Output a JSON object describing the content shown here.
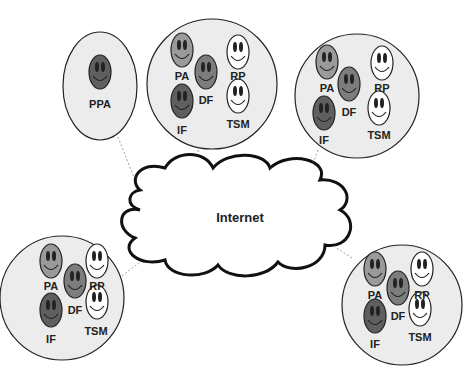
{
  "diagram": {
    "center_node": {
      "label": "Internet",
      "shape": "cloud"
    },
    "colors": {
      "group_fill": "#ececec",
      "stroke": "#222222",
      "agent_light": "#9a9a9a",
      "agent_mid": "#7d7d7d",
      "agent_dark": "#5f5f5f",
      "agent_white": "#ffffff",
      "link": "#888888"
    },
    "groups": [
      {
        "id": "ppa-group",
        "agents": [
          {
            "label": "PPA",
            "shade": "dark"
          }
        ]
      },
      {
        "id": "top-center-group",
        "agents": [
          {
            "label": "PA",
            "shade": "light"
          },
          {
            "label": "RP",
            "shade": "white"
          },
          {
            "label": "DF",
            "shade": "mid"
          },
          {
            "label": "IF",
            "shade": "dark"
          },
          {
            "label": "TSM",
            "shade": "white"
          }
        ]
      },
      {
        "id": "top-right-group",
        "agents": [
          {
            "label": "PA",
            "shade": "light"
          },
          {
            "label": "RP",
            "shade": "white"
          },
          {
            "label": "DF",
            "shade": "mid"
          },
          {
            "label": "IF",
            "shade": "dark"
          },
          {
            "label": "TSM",
            "shade": "white"
          }
        ]
      },
      {
        "id": "bottom-left-group",
        "agents": [
          {
            "label": "PA",
            "shade": "light"
          },
          {
            "label": "RP",
            "shade": "white"
          },
          {
            "label": "DF",
            "shade": "mid"
          },
          {
            "label": "IF",
            "shade": "dark"
          },
          {
            "label": "TSM",
            "shade": "white"
          }
        ]
      },
      {
        "id": "bottom-right-group",
        "agents": [
          {
            "label": "PA",
            "shade": "light"
          },
          {
            "label": "RP",
            "shade": "white"
          },
          {
            "label": "DF",
            "shade": "mid"
          },
          {
            "label": "IF",
            "shade": "dark"
          },
          {
            "label": "TSM",
            "shade": "white"
          }
        ]
      }
    ],
    "links": "each group is connected to the Internet cloud by a dashed line"
  }
}
